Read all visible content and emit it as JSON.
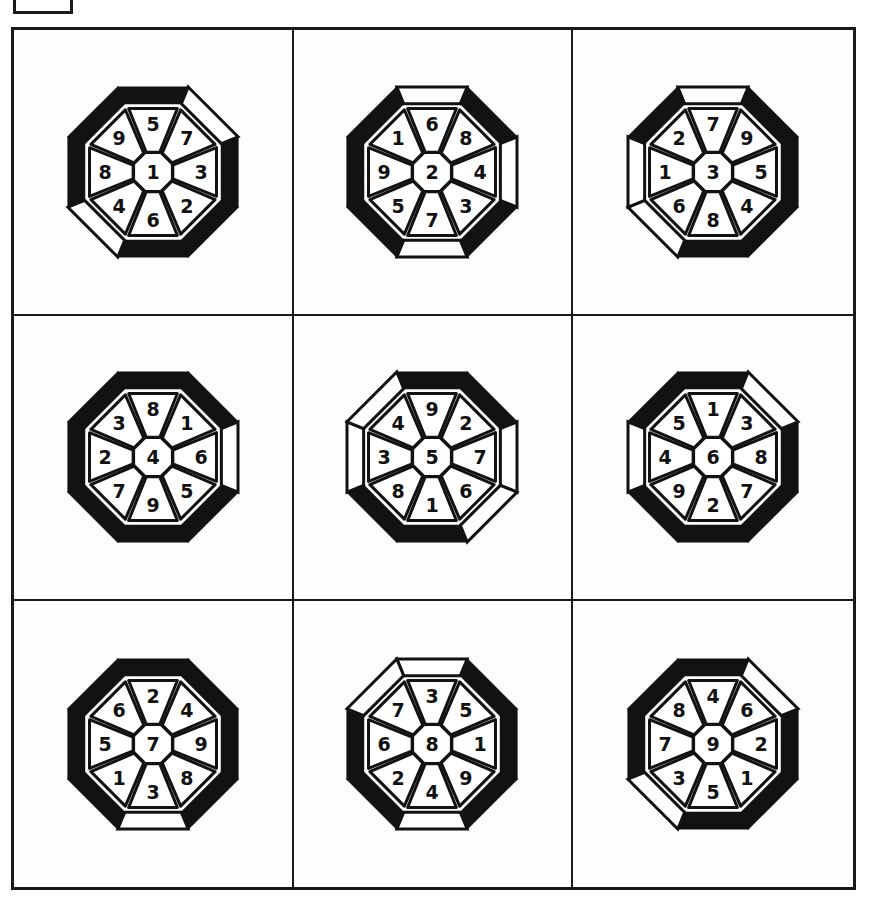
{
  "page": {
    "background_color": "#ffffff",
    "ink_color": "#121212",
    "grid_rows": 3,
    "grid_columns": 3
  },
  "corner_marker": {
    "name": "crop-marker-box",
    "label": ""
  },
  "wheels": [
    {
      "id": "wheel-1",
      "center": "1",
      "ring": [
        "5",
        "7",
        "3",
        "2",
        "6",
        "4",
        "8",
        "9"
      ],
      "ring_positions": [
        "top",
        "upper-right",
        "right",
        "lower-right",
        "bottom",
        "lower-left",
        "left",
        "upper-left"
      ],
      "outer_fill": [
        "black",
        "white",
        "black",
        "black",
        "black",
        "white",
        "black",
        "black"
      ]
    },
    {
      "id": "wheel-2",
      "center": "2",
      "ring": [
        "6",
        "8",
        "4",
        "3",
        "7",
        "5",
        "9",
        "1"
      ],
      "ring_positions": [
        "top",
        "upper-right",
        "right",
        "lower-right",
        "bottom",
        "lower-left",
        "left",
        "upper-left"
      ],
      "outer_fill": [
        "white",
        "black",
        "white",
        "black",
        "white",
        "black",
        "black",
        "black"
      ]
    },
    {
      "id": "wheel-3",
      "center": "3",
      "ring": [
        "7",
        "9",
        "5",
        "4",
        "8",
        "6",
        "1",
        "2"
      ],
      "ring_positions": [
        "top",
        "upper-right",
        "right",
        "lower-right",
        "bottom",
        "lower-left",
        "left",
        "upper-left"
      ],
      "outer_fill": [
        "white",
        "black",
        "black",
        "black",
        "black",
        "white",
        "white",
        "black"
      ]
    },
    {
      "id": "wheel-4",
      "center": "4",
      "ring": [
        "8",
        "1",
        "6",
        "5",
        "9",
        "7",
        "2",
        "3"
      ],
      "ring_positions": [
        "top",
        "upper-right",
        "right",
        "lower-right",
        "bottom",
        "lower-left",
        "left",
        "upper-left"
      ],
      "outer_fill": [
        "black",
        "black",
        "white",
        "black",
        "black",
        "black",
        "black",
        "black"
      ]
    },
    {
      "id": "wheel-5",
      "center": "5",
      "ring": [
        "9",
        "2",
        "7",
        "6",
        "1",
        "8",
        "3",
        "4"
      ],
      "ring_positions": [
        "top",
        "upper-right",
        "right",
        "lower-right",
        "bottom",
        "lower-left",
        "left",
        "upper-left"
      ],
      "outer_fill": [
        "black",
        "black",
        "white",
        "white",
        "black",
        "black",
        "white",
        "white"
      ]
    },
    {
      "id": "wheel-6",
      "center": "6",
      "ring": [
        "1",
        "3",
        "8",
        "7",
        "2",
        "9",
        "4",
        "5"
      ],
      "ring_positions": [
        "top",
        "upper-right",
        "right",
        "lower-right",
        "bottom",
        "lower-left",
        "left",
        "upper-left"
      ],
      "outer_fill": [
        "black",
        "white",
        "black",
        "black",
        "black",
        "black",
        "white",
        "black"
      ]
    },
    {
      "id": "wheel-7",
      "center": "7",
      "ring": [
        "2",
        "4",
        "9",
        "8",
        "3",
        "1",
        "5",
        "6"
      ],
      "ring_positions": [
        "top",
        "upper-right",
        "right",
        "lower-right",
        "bottom",
        "lower-left",
        "left",
        "upper-left"
      ],
      "outer_fill": [
        "black",
        "black",
        "black",
        "black",
        "white",
        "black",
        "black",
        "black"
      ]
    },
    {
      "id": "wheel-8",
      "center": "8",
      "ring": [
        "3",
        "5",
        "1",
        "9",
        "4",
        "2",
        "6",
        "7"
      ],
      "ring_positions": [
        "top",
        "upper-right",
        "right",
        "lower-right",
        "bottom",
        "lower-left",
        "left",
        "upper-left"
      ],
      "outer_fill": [
        "white",
        "black",
        "black",
        "black",
        "white",
        "black",
        "black",
        "white"
      ]
    },
    {
      "id": "wheel-9",
      "center": "9",
      "ring": [
        "4",
        "6",
        "2",
        "1",
        "5",
        "3",
        "7",
        "8"
      ],
      "ring_positions": [
        "top",
        "upper-right",
        "right",
        "lower-right",
        "bottom",
        "lower-left",
        "left",
        "upper-left"
      ],
      "outer_fill": [
        "black",
        "white",
        "black",
        "black",
        "black",
        "white",
        "black",
        "black"
      ]
    }
  ]
}
